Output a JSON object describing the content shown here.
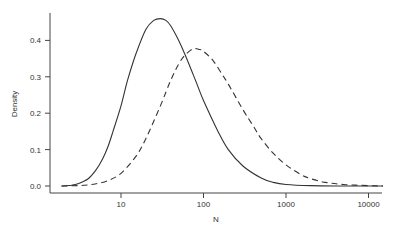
{
  "chart_data": {
    "type": "line",
    "title": "",
    "xlabel": "N",
    "ylabel": "Density",
    "x_scale": "log10",
    "xlim": [
      1.6,
      15000
    ],
    "ylim": [
      0,
      0.48
    ],
    "x_ticks": [
      10,
      100,
      1000,
      10000
    ],
    "x_tick_labels": [
      "10",
      "100",
      "1000",
      "10000"
    ],
    "y_ticks": [
      0.0,
      0.1,
      0.2,
      0.3,
      0.4
    ],
    "y_tick_labels": [
      "0.0",
      "0.1",
      "0.2",
      "0.3",
      "0.4"
    ],
    "grid": false,
    "legend": null,
    "series": [
      {
        "name": "solid",
        "style": "solid",
        "color": "#333333",
        "x": [
          1.9,
          2.5,
          3,
          4,
          5,
          6,
          7,
          8,
          10,
          12,
          15,
          20,
          25,
          30,
          35,
          40,
          50,
          60,
          80,
          100,
          150,
          200,
          300,
          500,
          700,
          1000,
          2000,
          5000,
          15000
        ],
        "y": [
          0.0,
          0.002,
          0.006,
          0.02,
          0.045,
          0.075,
          0.11,
          0.15,
          0.22,
          0.29,
          0.36,
          0.43,
          0.455,
          0.46,
          0.455,
          0.44,
          0.4,
          0.36,
          0.29,
          0.235,
          0.15,
          0.1,
          0.055,
          0.022,
          0.01,
          0.004,
          0.001,
          0.0,
          0.0
        ]
      },
      {
        "name": "dashed",
        "style": "dashed",
        "color": "#333333",
        "x": [
          1.9,
          3,
          4,
          5,
          7,
          10,
          15,
          20,
          30,
          40,
          50,
          60,
          75,
          90,
          100,
          130,
          170,
          200,
          300,
          400,
          500,
          700,
          1000,
          1500,
          2000,
          3000,
          5000,
          10000,
          15000
        ],
        "y": [
          0.0,
          0.001,
          0.003,
          0.006,
          0.015,
          0.035,
          0.08,
          0.13,
          0.22,
          0.29,
          0.335,
          0.36,
          0.377,
          0.375,
          0.37,
          0.345,
          0.305,
          0.28,
          0.21,
          0.165,
          0.13,
          0.09,
          0.058,
          0.032,
          0.02,
          0.01,
          0.004,
          0.001,
          0.0
        ]
      }
    ]
  }
}
